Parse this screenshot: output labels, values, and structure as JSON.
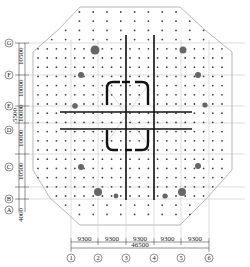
{
  "drawing": {
    "title": "Pile layout plan",
    "colors": {
      "background": "#ffffff",
      "outline": "#9a9a9a",
      "grid": "#b8b8b8",
      "pile": "#444444",
      "large_pile": "#666666",
      "wall": "#111111",
      "dimension": "#222222"
    },
    "column_axes": [
      "1",
      "2",
      "3",
      "4",
      "5",
      "6"
    ],
    "row_axes": [
      "A",
      "B",
      "C",
      "D",
      "E",
      "F",
      "G"
    ],
    "bottom_dimensions": {
      "spans": [
        "9300",
        "9300",
        "9300",
        "9300",
        "9300"
      ],
      "total": "46500"
    },
    "left_dimensions": {
      "spans": [
        "4000",
        "10500",
        "10000",
        "5500",
        "10000",
        "10500"
      ],
      "extra_label": "5500"
    }
  }
}
